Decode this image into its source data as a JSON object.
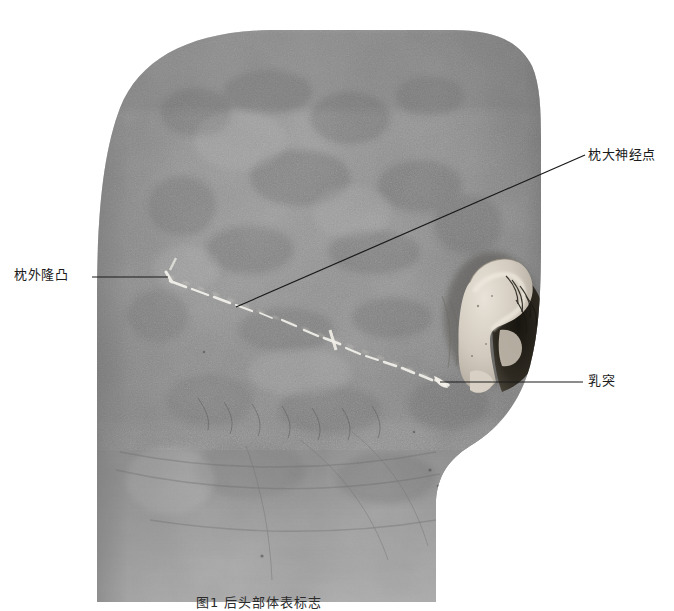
{
  "figure": {
    "background_color": "#ffffff",
    "line_color": "#1a1a1a",
    "mark_color": "#f2f0ea",
    "skin_base_color": "#8c8c8c",
    "width": 674,
    "height": 602
  },
  "annotations": [
    {
      "id": "external-occipital-protuberance",
      "label": "枕外隆凸",
      "label_x": 14,
      "label_y": 270,
      "leader": {
        "x1": 92,
        "y1": 277,
        "x2": 168,
        "y2": 277
      }
    },
    {
      "id": "greater-occipital-nerve-point",
      "label": "枕大神经点",
      "label_x": 588,
      "label_y": 148,
      "leader": {
        "x1": 236,
        "y1": 307,
        "x2": 585,
        "y2": 155
      }
    },
    {
      "id": "mastoid-process",
      "label": "乳突",
      "label_x": 588,
      "label_y": 375,
      "leader": {
        "x1": 440,
        "y1": 382,
        "x2": 583,
        "y2": 382
      }
    }
  ],
  "caption": {
    "text": "图1 后头部体表标志",
    "x": 196,
    "y": 592
  },
  "marking_line": {
    "name": "上项线标记线",
    "style": "白色虚线记号",
    "points": "168,277 196,283 214,292 240,303 262,311 286,318 310,327 332,336 352,344 372,352 392,360 412,370 432,378 446,383"
  }
}
